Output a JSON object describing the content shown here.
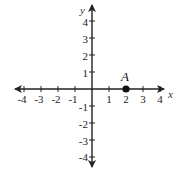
{
  "diagram": {
    "type": "coordinate-plane",
    "x_axis": {
      "label": "x",
      "min": -4,
      "max": 4,
      "ticks": [
        "-4",
        "-3",
        "-2",
        "-1",
        "1",
        "2",
        "3",
        "4"
      ]
    },
    "y_axis": {
      "label": "y",
      "min": -4,
      "max": 4,
      "ticks_pos": [
        "4",
        "3",
        "2",
        "1"
      ],
      "ticks_neg": [
        "-1",
        "-2",
        "-3",
        "-4"
      ]
    },
    "points": [
      {
        "label": "A",
        "x": 2,
        "y": 0
      }
    ],
    "colors": {
      "axis": "#222222",
      "point": "#111111"
    }
  }
}
